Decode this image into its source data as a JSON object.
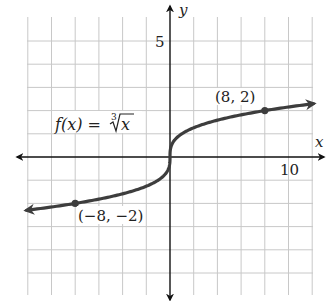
{
  "chart_data": {
    "type": "line",
    "title": "",
    "function_label": "f(x) = ∛x",
    "function_label_parts": {
      "lhs": "f(x) = ",
      "index": "3",
      "radicand": "x"
    },
    "xlabel": "x",
    "ylabel": "y",
    "xlim": [
      -12,
      12
    ],
    "ylim": [
      -5.7,
      6.5
    ],
    "grid": true,
    "x_grid_step": 2,
    "y_grid_step": 1,
    "x_tick_labels": [
      {
        "value": 10,
        "label": "10"
      }
    ],
    "y_tick_labels": [
      {
        "value": 5,
        "label": "5"
      }
    ],
    "series": [
      {
        "name": "f(x) = cube root of x",
        "x": [
          -12.1,
          -8,
          -6,
          -4,
          -2,
          -1,
          -0.5,
          -0.1,
          0,
          0.1,
          0.5,
          1,
          2,
          4,
          6,
          8,
          12.1
        ],
        "y": [
          -2.3,
          -2,
          -1.82,
          -1.59,
          -1.26,
          -1,
          -0.79,
          -0.46,
          0,
          0.46,
          0.79,
          1,
          1.26,
          1.59,
          1.82,
          2,
          2.3
        ],
        "arrows_both_ends": true,
        "color": "#3d3d3d"
      }
    ],
    "points": [
      {
        "x": -8,
        "y": -2,
        "label": "(−8, −2)"
      },
      {
        "x": 8,
        "y": 2,
        "label": "(8, 2)"
      }
    ],
    "annotations": [
      "f(x) = ∛x",
      "(8, 2)",
      "(−8, −2)"
    ]
  },
  "colors": {
    "grid": "#c8c8c8",
    "axis": "#111111",
    "curve": "#3d3d3d",
    "background": "#ffffff"
  }
}
